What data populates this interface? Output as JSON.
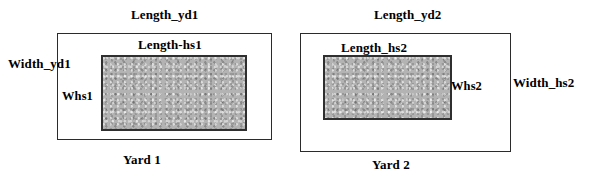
{
  "figure": {
    "type": "diagram",
    "background_color": "#ffffff",
    "outline_color": "#2b2b2b",
    "fill_color": "#b3b3b3",
    "top_ghost_text": "",
    "shapes": [
      {
        "name": "yard-1",
        "caption": "Yard 1",
        "outer": {
          "x": 57,
          "y": 33,
          "w": 215,
          "h": 107
        },
        "inner": {
          "x": 101,
          "y": 55,
          "w": 146,
          "h": 76
        },
        "labels": {
          "outer_length": "Length_yd1",
          "outer_width": "Width_yd1",
          "inner_length": "Length-hs1",
          "inner_width": "Whs1"
        }
      },
      {
        "name": "yard-2",
        "caption": "Yard 2",
        "outer": {
          "x": 300,
          "y": 33,
          "w": 211,
          "h": 119
        },
        "inner": {
          "x": 323,
          "y": 55,
          "w": 129,
          "h": 65
        },
        "labels": {
          "outer_length": "Length_yd2",
          "outer_width": "Width_hs2",
          "inner_length": "Length_hs2",
          "inner_width": "Whs2"
        }
      }
    ]
  }
}
